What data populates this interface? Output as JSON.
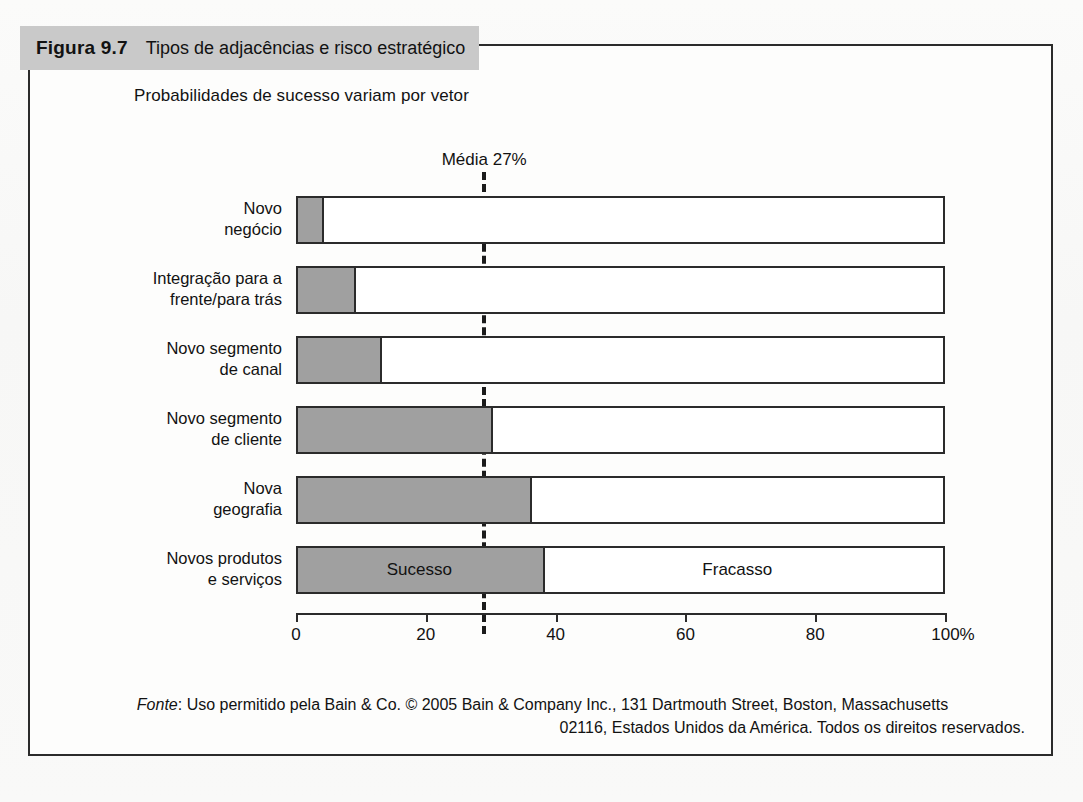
{
  "figure": {
    "number": "Figura 9.7",
    "caption": "Tipos de adjacências e risco estratégico",
    "banner_color": "#c9c9c9"
  },
  "chart_data": {
    "type": "bar",
    "orientation": "horizontal",
    "stacked": true,
    "title": "Probabilidades de sucesso variam por vetor",
    "xlabel": "",
    "ylabel": "",
    "xlim": [
      0,
      100
    ],
    "grid": false,
    "legend_position": "in-bar",
    "tick_labels": [
      "0",
      "20",
      "40",
      "60",
      "80",
      "100%"
    ],
    "ticks": [
      0,
      20,
      40,
      60,
      80,
      100
    ],
    "categories": [
      "Novo\nnegócio",
      "Integração para a\nfrente/para trás",
      "Novo segmento\nde canal",
      "Novo segmento\nde cliente",
      "Nova\ngeografia",
      "Novos produtos\ne serviços"
    ],
    "series": [
      {
        "name": "Sucesso",
        "color": "#a0a0a0",
        "values": [
          4,
          9,
          13,
          30,
          36,
          38
        ]
      },
      {
        "name": "Fracasso",
        "color": "#ffffff",
        "values": [
          96,
          91,
          87,
          70,
          64,
          62
        ]
      }
    ],
    "annotations": [
      {
        "name": "mean-line",
        "label": "Média 27%",
        "value": 29,
        "style": "dashed-vertical"
      }
    ],
    "series_tags": [
      {
        "label": "Sucesso",
        "row": 5,
        "at_percent": 19
      },
      {
        "label": "Fracasso",
        "row": 5,
        "at_percent": 68
      }
    ]
  },
  "source": {
    "prefix": "Fonte",
    "line1": ": Uso permitido pela Bain & Co. © 2005 Bain & Company Inc., 131 Dartmouth Street, Boston, Massachusetts",
    "line2": "02116, Estados Unidos da América. Todos os direitos reservados."
  }
}
